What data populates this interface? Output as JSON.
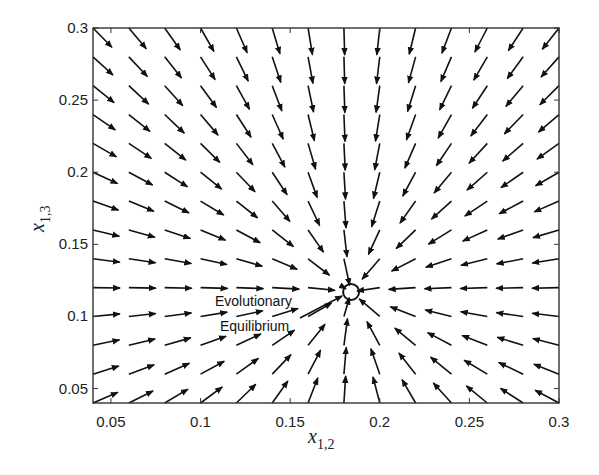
{
  "chart_data": {
    "type": "quiver",
    "title": "",
    "xlabel": "x_{1,2}",
    "ylabel": "x_{1,3}",
    "xlabel_main": "x",
    "xlabel_sub": "1,2",
    "ylabel_main": "x",
    "ylabel_sub": "1,3",
    "xlim": [
      0.04,
      0.3
    ],
    "ylim": [
      0.04,
      0.3
    ],
    "xticks": [
      0.05,
      0.1,
      0.15,
      0.2,
      0.25,
      0.3
    ],
    "xtick_labels": [
      "0.05",
      "0.1",
      "0.15",
      "0.2",
      "0.25",
      "0.3"
    ],
    "yticks": [
      0.05,
      0.1,
      0.15,
      0.2,
      0.25,
      0.3
    ],
    "ytick_labels": [
      "0.05",
      "0.1",
      "0.15",
      "0.2",
      "0.25",
      "0.3"
    ],
    "grid": false,
    "field": {
      "description": "Direction field converging to the evolutionary equilibrium; arrows of near-uniform length point toward the equilibrium point",
      "x_start": 0.04,
      "x_end": 0.3,
      "x_step": 0.02,
      "y_start": 0.04,
      "y_end": 0.3,
      "y_step": 0.02,
      "arrow_length_px": 27,
      "color": "#111111"
    },
    "equilibrium": {
      "x": 0.184,
      "y": 0.117,
      "marker": "open-circle"
    },
    "annotations": [
      {
        "text_line1": "Evolutionary",
        "text_line2": "Equilibrium",
        "x": 0.13,
        "y": 0.108,
        "points_to": "equilibrium"
      }
    ]
  },
  "labels": {
    "annotation_line1": "Evolutionary",
    "annotation_line2": "Equilibrium"
  },
  "colors": {
    "axes": "#333333",
    "arrows": "#111111",
    "background": "#ffffff"
  }
}
